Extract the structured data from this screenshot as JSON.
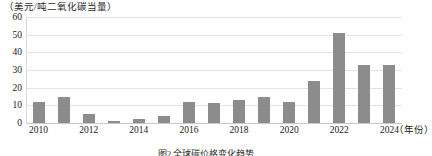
{
  "chart_data": {
    "type": "bar",
    "title": "",
    "unit_label": "（美元/吨二氧化碳当量）",
    "xlabel": "（年份）",
    "ylabel": "",
    "categories": [
      "2010",
      "2011",
      "2012",
      "2013",
      "2014",
      "2015",
      "2016",
      "2017",
      "2018",
      "2019",
      "2020",
      "2021",
      "2022",
      "2023",
      "2024"
    ],
    "values": [
      12,
      15,
      5,
      1,
      2,
      4,
      12,
      11.5,
      13,
      15,
      12,
      24,
      51,
      33,
      33
    ],
    "ylim": [
      0,
      60
    ],
    "yticks": [
      0,
      10,
      20,
      30,
      40,
      50,
      60
    ],
    "xticks_shown": [
      "2010",
      "2012",
      "2014",
      "2016",
      "2018",
      "2020",
      "2022",
      "2024"
    ],
    "grid": true,
    "legend": "none",
    "series_color": "#8c8c8c"
  },
  "caption": "图2 全球碳价格变化趋势",
  "colors": {
    "bar": "#8c8c8c",
    "grid": "#e3e3e3",
    "axis": "#c9c9c9",
    "text": "#1a1a1a"
  }
}
